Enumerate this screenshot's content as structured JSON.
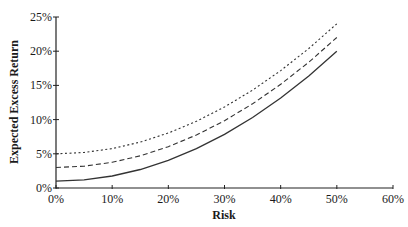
{
  "chart_data": {
    "type": "line",
    "title": "",
    "xlabel": "Risk",
    "ylabel": "Expected Excess Return",
    "xlim": [
      0,
      60
    ],
    "ylim": [
      0,
      25
    ],
    "x_ticks": [
      "0%",
      "10%",
      "20%",
      "30%",
      "40%",
      "50%",
      "60%"
    ],
    "y_ticks": [
      "0%",
      "5%",
      "10%",
      "15%",
      "20%",
      "25%"
    ],
    "grid": false,
    "legend": null,
    "x": [
      0,
      5,
      10,
      15,
      20,
      25,
      30,
      35,
      40,
      45,
      50
    ],
    "series": [
      {
        "name": "solid",
        "style": "solid",
        "values": [
          1.0,
          1.19,
          1.76,
          2.71,
          4.04,
          5.75,
          7.84,
          10.31,
          13.16,
          16.39,
          20.0
        ]
      },
      {
        "name": "dashed",
        "style": "dashed",
        "values": [
          3.0,
          3.19,
          3.76,
          4.71,
          6.04,
          7.75,
          9.84,
          12.31,
          15.16,
          18.39,
          22.0
        ]
      },
      {
        "name": "dotted",
        "style": "dotted",
        "values": [
          5.0,
          5.19,
          5.76,
          6.71,
          8.04,
          9.75,
          11.84,
          14.31,
          17.16,
          20.39,
          24.0
        ]
      }
    ]
  }
}
